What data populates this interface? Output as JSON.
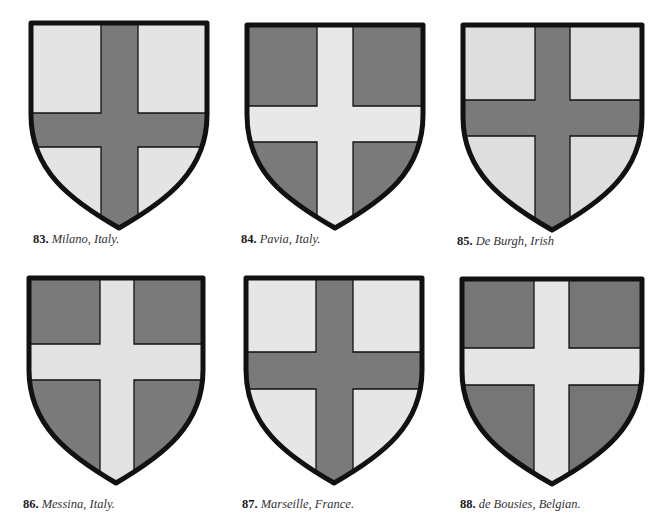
{
  "colors": {
    "dark": "#7a7a7a",
    "light": "#e4e4e4",
    "outline": "#111111",
    "background": "#ffffff"
  },
  "shields": [
    {
      "number": "83.",
      "name": "Milano, Italy.",
      "field": "light",
      "cross": "dark"
    },
    {
      "number": "84.",
      "name": "Pavia, Italy.",
      "field": "dark",
      "cross": "light"
    },
    {
      "number": "85.",
      "name": "De Burgh, Irish",
      "field": "light",
      "cross": "dark"
    },
    {
      "number": "86.",
      "name": "Messina, Italy.",
      "field": "dark",
      "cross": "light"
    },
    {
      "number": "87.",
      "name": "Marseille, France.",
      "field": "light",
      "cross": "dark"
    },
    {
      "number": "88.",
      "name": "de Bousies, Belgian.",
      "field": "dark",
      "cross": "light"
    }
  ]
}
